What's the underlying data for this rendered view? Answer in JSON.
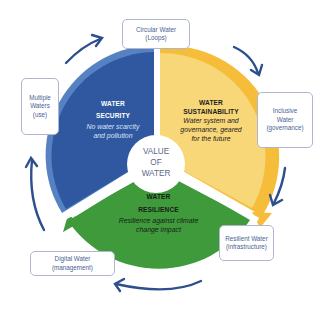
{
  "diagram": {
    "center": {
      "lines": [
        "VALUE",
        "OF",
        "WATER"
      ]
    },
    "segments": [
      {
        "id": "security",
        "title_lines": [
          "WATER",
          "SECURITY"
        ],
        "description_lines": [
          "No water scarcity",
          "and pollution"
        ],
        "color": "#2f58a0",
        "rim_color": "#5682c4",
        "text_color": "#ffffff"
      },
      {
        "id": "sustainability",
        "title_lines": [
          "WATER",
          "SUSTAINABILITY"
        ],
        "description_lines": [
          "Water system and",
          "governance, geared",
          "for the future"
        ],
        "color": "#f7d778",
        "rim_color": "#f6bd3a",
        "text_color": "#1d1d1d"
      },
      {
        "id": "resilience",
        "title_lines": [
          "WATER",
          "RESILIENCE"
        ],
        "description_lines": [
          "Resilience against climate",
          "change impact"
        ],
        "color": "#3e9a3a",
        "rim_color": "#3e9a3a",
        "text_color": "#1a1a1a"
      }
    ],
    "outer_boxes": [
      {
        "id": "circular",
        "lines": [
          "Circular Water",
          "(Loops)"
        ]
      },
      {
        "id": "inclusive",
        "lines": [
          "Inclusive",
          "Water",
          "(governance)"
        ]
      },
      {
        "id": "resilient",
        "lines": [
          "Resilient Water",
          "(infrastructure)"
        ]
      },
      {
        "id": "digital",
        "lines": [
          "Digital Water",
          "(management)"
        ]
      },
      {
        "id": "multiple",
        "lines": [
          "Multiple",
          "Waters",
          "(use)"
        ]
      }
    ],
    "arrow_color": "#2d4f8e",
    "box_border_color": "#aeb7cf",
    "box_text_color": "#4a5f96"
  }
}
